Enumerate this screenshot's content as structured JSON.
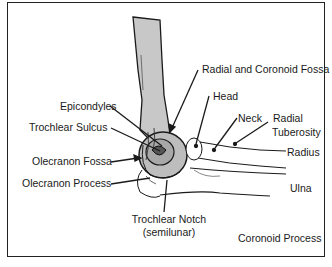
{
  "diagram": {
    "labels": {
      "radial_coronoid_fossa": "Radial and Coronoid Fossa",
      "epicondyles": "Epicondyles",
      "head": "Head",
      "trochlear_sulcus": "Trochlear Sulcus",
      "neck": "Neck",
      "radial_tuberosity_1": "Radial",
      "radial_tuberosity_2": "Tuberosity",
      "olecranon_fossa": "Olecranon Fossa",
      "radius": "Radius",
      "olecranon_process": "Olecranon Process",
      "ulna": "Ulna",
      "trochlear_notch_1": "Trochlear Notch",
      "trochlear_notch_2": "(semilunar)",
      "coronoid_process": "Coronoid Process"
    },
    "colors": {
      "bone_fill": "#c8c8c8",
      "line": "#1a1a1a",
      "border": "#222222"
    }
  }
}
